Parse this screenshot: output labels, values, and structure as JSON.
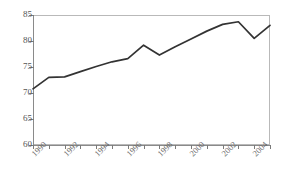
{
  "chart_data": {
    "type": "line",
    "title": "",
    "subtitle": "",
    "xlabel": "",
    "ylabel": "",
    "ylim": [
      60,
      85
    ],
    "xlim": [
      1990,
      2005
    ],
    "y_ticks": [
      60,
      65,
      70,
      75,
      80,
      85
    ],
    "x_ticks": [
      1990,
      1991,
      1992,
      1993,
      1994,
      1995,
      1996,
      1997,
      1998,
      1999,
      2000,
      2001,
      2002,
      2003,
      2004,
      2005
    ],
    "x_tick_labels": [
      "1990",
      "",
      "1992",
      "",
      "1994",
      "",
      "1996",
      "",
      "1998",
      "",
      "2000",
      "",
      "2002",
      "",
      "2004",
      ""
    ],
    "grid": false,
    "legend": false,
    "legend_position": "none",
    "x": [
      1990,
      1991,
      1992,
      1993,
      1994,
      1995,
      1996,
      1997,
      1998,
      1999,
      2000,
      2001,
      2002,
      2003,
      2004,
      2005
    ],
    "values": [
      70.8,
      73.0,
      73.1,
      74.1,
      75.1,
      76.0,
      76.6,
      79.2,
      77.3,
      78.9,
      80.4,
      81.9,
      83.2,
      83.7,
      80.5,
      83.0
    ],
    "series": [
      {
        "name": "series-1",
        "color": "#333333",
        "values": [
          70.8,
          73.0,
          73.1,
          74.1,
          75.1,
          76.0,
          76.6,
          79.2,
          77.3,
          78.9,
          80.4,
          81.9,
          83.2,
          83.7,
          80.5,
          83.0
        ]
      }
    ],
    "annotations": []
  },
  "axes": {
    "y_tick_labels": [
      "85",
      "80",
      "75",
      "70",
      "65",
      "60"
    ],
    "x_tick_labels_visible": [
      "1990",
      "1992",
      "1994",
      "1996",
      "1998",
      "2000",
      "2002",
      "2004"
    ]
  },
  "colors": {
    "line": "#333333",
    "axis": "#8a8a8a",
    "frame": "#b9b9b9",
    "tick_text": "#5a5a5a",
    "background": "#ffffff"
  }
}
